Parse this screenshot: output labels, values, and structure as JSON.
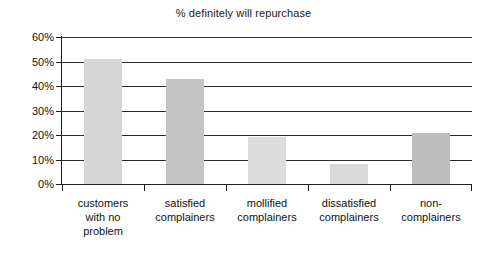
{
  "chart_data": {
    "type": "bar",
    "title": "% definitely will repurchase",
    "xlabel": "",
    "ylabel": "",
    "ylim": [
      0,
      60
    ],
    "ytick_values": [
      0,
      10,
      20,
      30,
      40,
      50,
      60
    ],
    "ytick_labels": [
      "0%",
      "10%",
      "20%",
      "30%",
      "40%",
      "50%",
      "60%"
    ],
    "grid": "horizontal",
    "legend": "none",
    "categories": [
      "customers\nwith no\nproblem",
      "satisfied\ncomplainers",
      "mollified\ncomplainers",
      "dissatisfied\ncomplainers",
      "non-\ncomplainers"
    ],
    "values": [
      51,
      43,
      19,
      8,
      21
    ],
    "bar_colors": [
      "#d6d6d6",
      "#c4c4c4",
      "#dcdcdc",
      "#d9d9d9",
      "#bdbdbd"
    ],
    "axis_color": "#1d1d1d",
    "gridline_color": "#2b2b2b",
    "background": "#ffffff"
  }
}
